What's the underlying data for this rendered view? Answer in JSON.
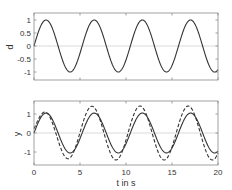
{
  "chart_data": [
    {
      "type": "line",
      "title": "",
      "xlabel": "",
      "ylabel": "d",
      "xlim": [
        0,
        20
      ],
      "ylim": [
        -1.27,
        1.31
      ],
      "xticks": [
        0,
        5,
        10,
        15,
        20
      ],
      "xtick_labels_visible": false,
      "yticks": [
        -1,
        -0.5,
        0,
        0.5,
        1
      ],
      "ytick_labels": [
        "-1",
        "-0.5",
        "0",
        "0.5",
        "1"
      ],
      "grid": false,
      "zero_line": true,
      "series": [
        {
          "name": "d",
          "style": "solid",
          "function": "sin(1.2*t)",
          "x": [
            0,
            1.3,
            2.6,
            3.9,
            5.2,
            6.5,
            7.9,
            9.2,
            10.5,
            11.8,
            13.1,
            14.4,
            15.7,
            17.0,
            18.3,
            19.6,
            20
          ],
          "values": [
            0,
            1,
            0,
            -1,
            0,
            1,
            0,
            -1,
            0,
            1,
            0,
            -1,
            0,
            1,
            0,
            -1,
            -0.95
          ]
        }
      ]
    },
    {
      "type": "line",
      "title": "",
      "xlabel": "t in s",
      "ylabel": "y",
      "xlim": [
        0,
        20
      ],
      "ylim": [
        -1.68,
        1.68
      ],
      "xticks": [
        0,
        5,
        10,
        15,
        20
      ],
      "xtick_labels": [
        "0",
        "5",
        "10",
        "15",
        "20"
      ],
      "yticks": [
        -1,
        0,
        1
      ],
      "ytick_labels": [
        "-1",
        "0",
        "1"
      ],
      "grid": false,
      "zero_line": true,
      "series": [
        {
          "name": "y (solid)",
          "style": "solid",
          "x": [
            0,
            1.2,
            2.6,
            3.9,
            5.2,
            6.6,
            7.9,
            9.2,
            10.5,
            11.8,
            13.1,
            14.4,
            15.7,
            17.0,
            18.3,
            19.6,
            20
          ],
          "values": [
            0,
            0.95,
            0.1,
            -1.1,
            -0.05,
            1.05,
            0,
            -1.05,
            0,
            1.05,
            0,
            -1.05,
            0,
            1.05,
            0,
            -1.05,
            -0.9
          ]
        },
        {
          "name": "y (dashed)",
          "style": "dashed",
          "x": [
            0,
            1.3,
            2.6,
            3.8,
            5.0,
            6.3,
            7.6,
            8.9,
            10.2,
            11.5,
            12.8,
            14.1,
            15.4,
            16.7,
            18.0,
            19.3,
            20
          ],
          "values": [
            0,
            0.75,
            -0.2,
            -1.35,
            -0.1,
            1.42,
            0,
            -1.42,
            0,
            1.42,
            0,
            -1.42,
            0,
            1.42,
            0,
            -1.42,
            -0.95
          ]
        }
      ]
    }
  ],
  "plots": {
    "top": {
      "ylabel": "d",
      "yticks": [
        {
          "v": 1,
          "label": "1"
        },
        {
          "v": 0.5,
          "label": "0.5"
        },
        {
          "v": 0,
          "label": "0"
        },
        {
          "v": -0.5,
          "label": "-0.5"
        },
        {
          "v": -1,
          "label": "-1"
        }
      ]
    },
    "bottom": {
      "ylabel": "y",
      "xlabel": "t in s",
      "yticks": [
        {
          "v": 1,
          "label": "1"
        },
        {
          "v": 0,
          "label": "0"
        },
        {
          "v": -1,
          "label": "-1"
        }
      ],
      "xticks": [
        {
          "v": 0,
          "label": "0"
        },
        {
          "v": 5,
          "label": "5"
        },
        {
          "v": 10,
          "label": "10"
        },
        {
          "v": 15,
          "label": "15"
        },
        {
          "v": 20,
          "label": "20"
        }
      ]
    }
  },
  "colors": {
    "line": "#333333",
    "frame": "#8a8a8a",
    "zero_line": "#d0d0d0",
    "text": "#333333"
  }
}
